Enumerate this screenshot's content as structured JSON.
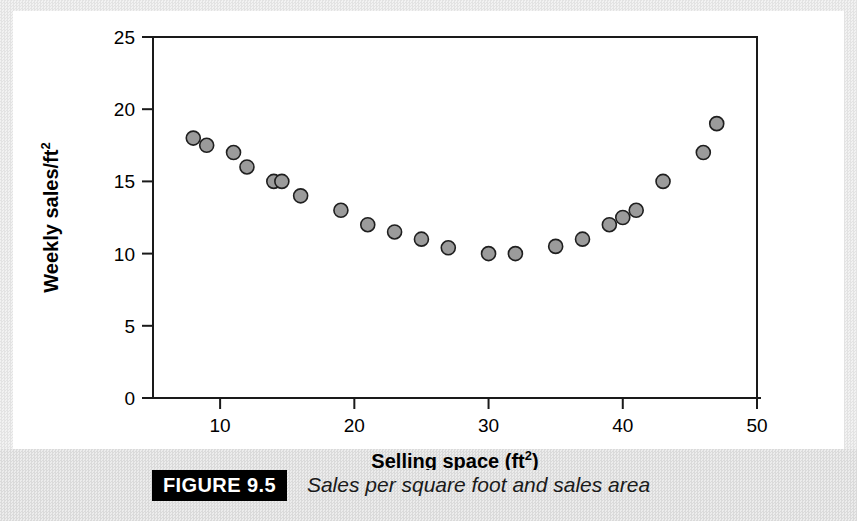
{
  "figure": {
    "tag": "FIGURE 9.5",
    "caption": "Sales per square foot and sales area"
  },
  "colors": {
    "marker_fill": "#9b9b9b",
    "marker_stroke": "#1f1f1f",
    "axis": "#1a1a1a",
    "plot_background": "#ffffff",
    "page_border": "#e4e4e4",
    "tag_background": "#000000",
    "tag_text": "#ffffff"
  },
  "chart_data": {
    "type": "scatter",
    "title": "",
    "xlabel": "Selling space (ft2)",
    "xlabel_base": "Selling space (ft",
    "xlabel_sup": "2",
    "xlabel_close": ")",
    "ylabel": "Weekly sales/ft2",
    "ylabel_base": "Weekly sales/ft",
    "ylabel_sup": "2",
    "xlim": [
      5,
      50
    ],
    "ylim": [
      0,
      25
    ],
    "xticks": [
      10,
      20,
      30,
      40,
      50
    ],
    "yticks": [
      0,
      5,
      10,
      15,
      20,
      25
    ],
    "xtick_labels": [
      "10",
      "20",
      "30",
      "40",
      "50"
    ],
    "ytick_labels": [
      "0",
      "5",
      "10",
      "15",
      "20",
      "25"
    ],
    "grid": false,
    "legend": false,
    "marker_radius": 7,
    "points": [
      {
        "x": 8.0,
        "y": 18.0
      },
      {
        "x": 9.0,
        "y": 17.5
      },
      {
        "x": 11.0,
        "y": 17.0
      },
      {
        "x": 12.0,
        "y": 16.0
      },
      {
        "x": 14.0,
        "y": 15.0
      },
      {
        "x": 14.6,
        "y": 15.0
      },
      {
        "x": 16.0,
        "y": 14.0
      },
      {
        "x": 19.0,
        "y": 13.0
      },
      {
        "x": 21.0,
        "y": 12.0
      },
      {
        "x": 23.0,
        "y": 11.5
      },
      {
        "x": 25.0,
        "y": 11.0
      },
      {
        "x": 27.0,
        "y": 10.4
      },
      {
        "x": 30.0,
        "y": 10.0
      },
      {
        "x": 32.0,
        "y": 10.0
      },
      {
        "x": 35.0,
        "y": 10.5
      },
      {
        "x": 37.0,
        "y": 11.0
      },
      {
        "x": 39.0,
        "y": 12.0
      },
      {
        "x": 40.0,
        "y": 12.5
      },
      {
        "x": 41.0,
        "y": 13.0
      },
      {
        "x": 43.0,
        "y": 15.0
      },
      {
        "x": 46.0,
        "y": 17.0
      },
      {
        "x": 47.0,
        "y": 19.0
      }
    ]
  }
}
